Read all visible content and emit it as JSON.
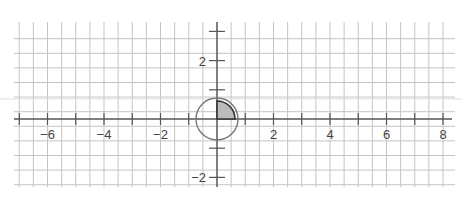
{
  "figure": {
    "type": "coordinate-plane",
    "x_axis": {
      "min": -7,
      "max": 8,
      "labeled_ticks": [
        -6,
        -4,
        -2,
        2,
        4,
        6,
        8
      ],
      "labels": [
        "−6",
        "−4",
        "−2",
        "2",
        "4",
        "6",
        "8"
      ]
    },
    "y_axis": {
      "min": -2,
      "max": 3,
      "labeled_ticks": [
        2,
        -2
      ],
      "labels": [
        "2",
        "−2"
      ]
    },
    "grid": {
      "on": true,
      "step": 0.5
    },
    "shapes": [
      {
        "kind": "circle",
        "center": [
          0,
          0
        ],
        "radius": 0.75,
        "stroke": "#777777"
      },
      {
        "kind": "sector",
        "center": [
          0,
          0
        ],
        "radius": 0.62,
        "start_deg": 0,
        "end_deg": 90,
        "fill": "#bbbbbb",
        "stroke": "#333333"
      }
    ],
    "colors": {
      "grid": "#bdbdbd",
      "axis": "#555555",
      "background": "#ffffff"
    }
  }
}
